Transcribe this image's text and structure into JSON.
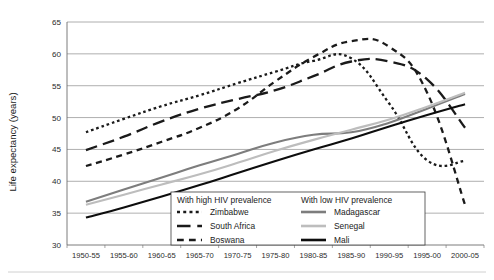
{
  "chart_data": {
    "type": "line",
    "title": "",
    "xlabel": "",
    "ylabel": "Life expectancy (years)",
    "ylim": [
      30,
      65
    ],
    "ytick_values": [
      30,
      35,
      40,
      45,
      50,
      55,
      60,
      65
    ],
    "ytick_labels": [
      "30",
      "35",
      "40",
      "45",
      "50",
      "55",
      "60",
      "65"
    ],
    "grid": true,
    "legend_position": "inside-bottom-center",
    "categories": [
      "1950-55",
      "1955-60",
      "1960-65",
      "1965-70",
      "1970-75",
      "1975-80",
      "1980-85",
      "1985-90",
      "1990-95",
      "1995-00",
      "2000-05"
    ],
    "series": [
      {
        "name": "Zimbabwe",
        "group": "With high HIV prevalence",
        "style": "dotted",
        "color": "#1a1a1a",
        "values": [
          47.7,
          49.8,
          51.8,
          53.5,
          55.4,
          57.2,
          58.9,
          59.3,
          52.2,
          43.3,
          43.2
        ]
      },
      {
        "name": "South Africa",
        "group": "With high HIV prevalence",
        "style": "long-dash",
        "color": "#1a1a1a",
        "values": [
          44.9,
          47.0,
          49.4,
          51.4,
          52.9,
          54.3,
          56.5,
          58.8,
          58.8,
          56.0,
          48.4
        ]
      },
      {
        "name": "Boswana",
        "group": "With high HIV prevalence",
        "style": "dash",
        "color": "#1a1a1a",
        "values": [
          42.4,
          44.2,
          46.2,
          48.4,
          51.4,
          55.7,
          59.5,
          62.0,
          61.1,
          53.9,
          36.3
        ]
      },
      {
        "name": "Madagascar",
        "group": "With low HIV prevalence",
        "style": "solid",
        "color": "#7d7d7d",
        "values": [
          36.8,
          38.7,
          40.6,
          42.5,
          44.3,
          46.1,
          47.3,
          47.7,
          49.2,
          51.4,
          53.7
        ]
      },
      {
        "name": "Senegal",
        "group": "With low HIV prevalence",
        "style": "solid",
        "color": "#bdbdbd",
        "values": [
          36.3,
          37.9,
          39.5,
          41.1,
          42.9,
          44.8,
          46.5,
          48.1,
          49.7,
          51.7,
          53.9
        ]
      },
      {
        "name": "Mali",
        "group": "With low HIV prevalence",
        "style": "solid",
        "color": "#0d0d0d",
        "values": [
          34.3,
          35.9,
          37.6,
          39.4,
          41.3,
          43.2,
          45.0,
          46.7,
          48.6,
          50.4,
          52.1
        ]
      }
    ]
  },
  "legend": {
    "left_heading": "With high HIV prevalence",
    "right_heading": "With low HIV prevalence",
    "left_items": [
      "Zimbabwe",
      "South Africa",
      "Boswana"
    ],
    "right_items": [
      "Madagascar",
      "Senegal",
      "Mali"
    ]
  }
}
